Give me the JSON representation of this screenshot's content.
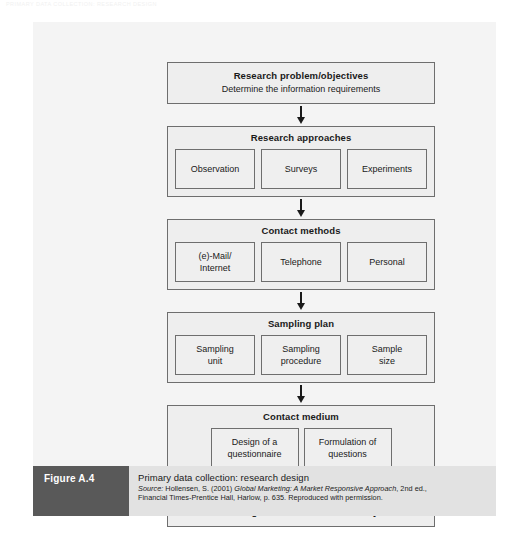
{
  "page_header": "PRIMARY DATA COLLECTION: RESEARCH DESIGN",
  "figure": {
    "label": "Figure A.4",
    "caption_title": "Primary data collection: research design",
    "source_label": "Source:",
    "source_line1_pre": " Hollensen, S. (2001) ",
    "source_line1_italic": "Global Marketing: A Market Responsive Approach",
    "source_line1_post": ", 2nd ed.,",
    "source_line2": "Financial Times-Prentice Hall, Harlow, p. 635. Reproduced with permission."
  },
  "diagram": {
    "stages": [
      {
        "title": "Research problem/objectives",
        "subtitle": "Determine the information requirements",
        "cells": []
      },
      {
        "title": "Research approaches",
        "subtitle": "",
        "cells": [
          "Observation",
          "Surveys",
          "Experiments"
        ]
      },
      {
        "title": "Contact methods",
        "subtitle": "",
        "cells": [
          "(e)-Mail/\nInternet",
          "Telephone",
          "Personal"
        ]
      },
      {
        "title": "Sampling plan",
        "subtitle": "",
        "cells": [
          "Sampling\nunit",
          "Sampling\nprocedure",
          "Sample\nsize"
        ]
      },
      {
        "title": "Contact medium",
        "subtitle": "",
        "cells": [
          "Design of a\nquestionnaire",
          "Formulation of\nquestions"
        ]
      },
      {
        "title": "Pretesting/data collection/data analysis",
        "subtitle": "",
        "cells": []
      }
    ]
  },
  "colors": {
    "panel_bg": "#f4f4f4",
    "box_bg": "#eeeeee",
    "box_border": "#6e6e6e",
    "caption_bg": "#e2e2e2",
    "label_bg": "#595959",
    "arrow": "#1a1a1a"
  }
}
